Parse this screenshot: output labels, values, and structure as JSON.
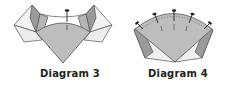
{
  "diagrams": [
    {
      "caption": "Diagram 3",
      "pin_count": 1
    },
    {
      "caption": "Diagram 4",
      "pin_count": 5
    }
  ],
  "colors": {
    "fan_fill": "#bdbdbd",
    "flap_dark": "#9a9a9a",
    "flap_light": "#f0f0f0",
    "outline": "#555555",
    "pin": "#222222",
    "text": "#222222"
  }
}
